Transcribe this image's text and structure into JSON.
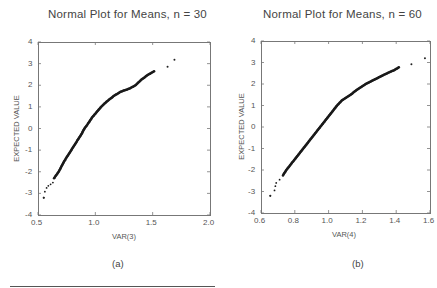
{
  "chart_data": [
    {
      "type": "scatter",
      "panel": "(a)",
      "title": "Normal Plot for Means, n = 30",
      "xlabel": "VAR(3)",
      "ylabel": "EXPECTED VALUE",
      "xlim": [
        0.5,
        2.0
      ],
      "ylim": [
        -4,
        4
      ],
      "xticks": [
        "0.5",
        "1.0",
        "1.5",
        "2.0"
      ],
      "yticks": [
        "4",
        "3",
        "2",
        "1",
        "0",
        "-1",
        "-2",
        "-3",
        "-4"
      ],
      "grid": false,
      "series": [
        {
          "name": "normal scores",
          "points": [
            [
              0.55,
              -3.2
            ],
            [
              0.56,
              -2.92
            ],
            [
              0.575,
              -2.75
            ],
            [
              0.59,
              -2.65
            ],
            [
              0.61,
              -2.58
            ],
            [
              0.63,
              -2.5
            ],
            [
              0.64,
              -2.3
            ],
            [
              0.66,
              -2.15
            ],
            [
              0.68,
              -2.0
            ],
            [
              0.7,
              -1.8
            ],
            [
              0.73,
              -1.5
            ],
            [
              0.76,
              -1.25
            ],
            [
              0.79,
              -1.0
            ],
            [
              0.82,
              -0.75
            ],
            [
              0.85,
              -0.5
            ],
            [
              0.88,
              -0.25
            ],
            [
              0.905,
              0.0
            ],
            [
              0.94,
              0.25
            ],
            [
              0.97,
              0.5
            ],
            [
              1.01,
              0.75
            ],
            [
              1.05,
              1.0
            ],
            [
              1.1,
              1.25
            ],
            [
              1.16,
              1.5
            ],
            [
              1.22,
              1.7
            ],
            [
              1.3,
              1.85
            ],
            [
              1.35,
              2.0
            ],
            [
              1.4,
              2.25
            ],
            [
              1.45,
              2.45
            ],
            [
              1.49,
              2.58
            ],
            [
              1.52,
              2.67
            ],
            [
              1.63,
              2.85
            ],
            [
              1.69,
              3.18
            ]
          ]
        }
      ],
      "caption": "(a)"
    },
    {
      "type": "scatter",
      "panel": "(b)",
      "title": "Normal Plot for Means, n = 60",
      "xlabel": "VAR(4)",
      "ylabel": "EXPECTED VALUE",
      "xlim": [
        0.6,
        1.6
      ],
      "ylim": [
        -4,
        4
      ],
      "xticks": [
        "0.6",
        "0.8",
        "1.0",
        "1.2",
        "1.4",
        "1.6"
      ],
      "yticks": [
        "4",
        "3",
        "2",
        "1",
        "0",
        "-1",
        "-2",
        "-3",
        "-4"
      ],
      "grid": false,
      "series": [
        {
          "name": "normal scores",
          "points": [
            [
              0.655,
              -3.2
            ],
            [
              0.68,
              -2.95
            ],
            [
              0.685,
              -2.75
            ],
            [
              0.69,
              -2.6
            ],
            [
              0.71,
              -2.45
            ],
            [
              0.73,
              -2.25
            ],
            [
              0.75,
              -2.0
            ],
            [
              0.77,
              -1.8
            ],
            [
              0.8,
              -1.5
            ],
            [
              0.825,
              -1.25
            ],
            [
              0.85,
              -1.0
            ],
            [
              0.875,
              -0.75
            ],
            [
              0.9,
              -0.5
            ],
            [
              0.925,
              -0.25
            ],
            [
              0.95,
              0.0
            ],
            [
              0.975,
              0.25
            ],
            [
              1.0,
              0.5
            ],
            [
              1.025,
              0.75
            ],
            [
              1.05,
              1.0
            ],
            [
              1.08,
              1.25
            ],
            [
              1.13,
              1.5
            ],
            [
              1.17,
              1.75
            ],
            [
              1.22,
              2.0
            ],
            [
              1.27,
              2.2
            ],
            [
              1.32,
              2.4
            ],
            [
              1.36,
              2.55
            ],
            [
              1.39,
              2.65
            ],
            [
              1.42,
              2.8
            ],
            [
              1.49,
              2.92
            ],
            [
              1.57,
              3.2
            ]
          ]
        }
      ],
      "caption": "(b)"
    }
  ]
}
